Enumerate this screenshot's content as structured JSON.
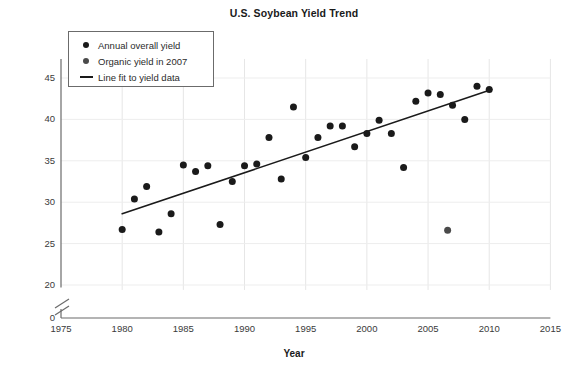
{
  "chart_data": {
    "type": "scatter",
    "title": "U.S. Soybean Yield Trend",
    "xlabel": "Year",
    "ylabel": "Bushels per acre",
    "xlim": [
      1975,
      2015
    ],
    "ylim": [
      20,
      47
    ],
    "y_axis_break": true,
    "y_break_from": 0,
    "y_break_to": 20,
    "grid": true,
    "legend_position": "top-left",
    "xticks": [
      1975,
      1980,
      1985,
      1990,
      1995,
      2000,
      2005,
      2010,
      2015
    ],
    "yticks": [
      0,
      20,
      25,
      30,
      35,
      40,
      45
    ],
    "series": [
      {
        "name": "Annual overall yield",
        "marker": "circle",
        "color": "#1a1a1a",
        "points": [
          {
            "x": 1980,
            "y": 26.7
          },
          {
            "x": 1981,
            "y": 30.4
          },
          {
            "x": 1982,
            "y": 31.9
          },
          {
            "x": 1983,
            "y": 26.4
          },
          {
            "x": 1984,
            "y": 28.6
          },
          {
            "x": 1985,
            "y": 34.5
          },
          {
            "x": 1986,
            "y": 33.7
          },
          {
            "x": 1987,
            "y": 34.4
          },
          {
            "x": 1988,
            "y": 27.3
          },
          {
            "x": 1989,
            "y": 32.5
          },
          {
            "x": 1990,
            "y": 34.4
          },
          {
            "x": 1991,
            "y": 34.6
          },
          {
            "x": 1992,
            "y": 37.8
          },
          {
            "x": 1993,
            "y": 32.8
          },
          {
            "x": 1994,
            "y": 41.5
          },
          {
            "x": 1995,
            "y": 35.4
          },
          {
            "x": 1996,
            "y": 37.8
          },
          {
            "x": 1997,
            "y": 39.2
          },
          {
            "x": 1998,
            "y": 39.2
          },
          {
            "x": 1999,
            "y": 36.7
          },
          {
            "x": 2000,
            "y": 38.3
          },
          {
            "x": 2001,
            "y": 39.9
          },
          {
            "x": 2002,
            "y": 38.3
          },
          {
            "x": 2003,
            "y": 34.2
          },
          {
            "x": 2004,
            "y": 42.2
          },
          {
            "x": 2005,
            "y": 43.2
          },
          {
            "x": 2006,
            "y": 43.0
          },
          {
            "x": 2007,
            "y": 41.7
          },
          {
            "x": 2008,
            "y": 40.0
          },
          {
            "x": 2009,
            "y": 44.0
          },
          {
            "x": 2010,
            "y": 43.6
          }
        ]
      },
      {
        "name": "Organic yield in 2007",
        "marker": "circle",
        "color": "#4a4a4a",
        "points": [
          {
            "x": 2006.6,
            "y": 26.6
          }
        ]
      }
    ],
    "fit_line": {
      "name": "Line fit to yield data",
      "color": "#1a1a1a",
      "x_start": 1980,
      "y_start": 28.6,
      "x_end": 2010.2,
      "y_end": 43.6
    },
    "legend": [
      {
        "label": "Annual overall yield",
        "marker": "dot",
        "color": "#1a1a1a"
      },
      {
        "label": "Organic yield in 2007",
        "marker": "dot",
        "color": "#4a4a4a"
      },
      {
        "label": "Line fit to yield data",
        "marker": "line",
        "color": "#1a1a1a"
      }
    ]
  }
}
